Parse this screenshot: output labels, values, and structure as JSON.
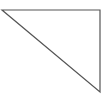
{
  "diagram": {
    "shape": "right-triangle",
    "stroke_color": "#555555",
    "fill_color": "#ffffff",
    "vertices": [
      [
        2,
        10
      ],
      [
        100,
        10
      ],
      [
        100,
        92
      ]
    ]
  }
}
